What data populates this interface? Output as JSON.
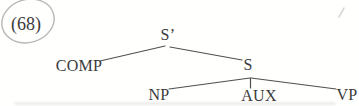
{
  "example_number": "(68)",
  "tree": {
    "type": "syntax-tree",
    "nodes": [
      {
        "id": "s-bar",
        "label": "S’"
      },
      {
        "id": "comp",
        "label": "COMP"
      },
      {
        "id": "s",
        "label": "S"
      },
      {
        "id": "np",
        "label": "NP"
      },
      {
        "id": "aux",
        "label": "AUX"
      },
      {
        "id": "vp",
        "label": "VP"
      }
    ],
    "edges": [
      [
        "S’",
        "COMP"
      ],
      [
        "S’",
        "S"
      ],
      [
        "S",
        "NP"
      ],
      [
        "S",
        "AUX"
      ],
      [
        "S",
        "VP"
      ]
    ]
  },
  "annotations": {
    "example_circle": "hand-drawn ellipse around example number"
  },
  "colors": {
    "text": "#3a3a3a",
    "tree_line": "#4f4f4f",
    "annotation_circle": "#b8b8b8",
    "background": "#ffffff"
  }
}
